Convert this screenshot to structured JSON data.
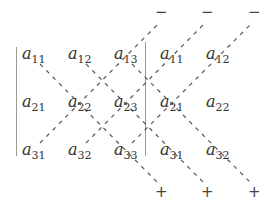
{
  "matrix": [
    [
      {
        "base": "a",
        "sub": "11"
      },
      {
        "base": "a",
        "sub": "12"
      },
      {
        "base": "a",
        "sub": "13"
      }
    ],
    [
      {
        "base": "a",
        "sub": "21"
      },
      {
        "base": "a",
        "sub": "22"
      },
      {
        "base": "a",
        "sub": "23"
      }
    ],
    [
      {
        "base": "a",
        "sub": "31"
      },
      {
        "base": "a",
        "sub": "32"
      },
      {
        "base": "a",
        "sub": "33"
      }
    ]
  ],
  "augmented_columns": [
    [
      {
        "base": "a",
        "sub": "11"
      },
      {
        "base": "a",
        "sub": "12"
      }
    ],
    [
      {
        "base": "a",
        "sub": "21"
      },
      {
        "base": "a",
        "sub": "22"
      }
    ],
    [
      {
        "base": "a",
        "sub": "31"
      },
      {
        "base": "a",
        "sub": "32"
      }
    ]
  ],
  "signs": {
    "top": [
      "−",
      "−",
      "−"
    ],
    "bottom": [
      "+",
      "+",
      "+"
    ]
  },
  "colors": {
    "text": "#333333",
    "lines": "#555555"
  }
}
